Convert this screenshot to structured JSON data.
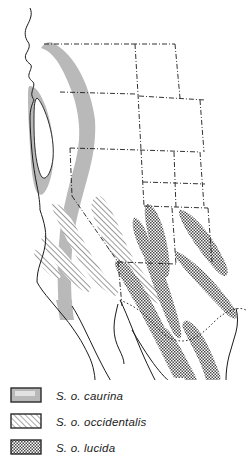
{
  "figure": {
    "kind": "range-map",
    "region": "Western United States and northwestern Mexico",
    "background_color": "#ffffff",
    "line_color": "#1b1b1b",
    "border_style": "dash-dot"
  },
  "legend": {
    "position": "bottom-left",
    "items": [
      {
        "id": "caurina",
        "label": "S. o. caurina",
        "pattern": "solid-gray",
        "fill_color": "#b9b9b9",
        "swatch_border": "#2a2a2a"
      },
      {
        "id": "occidentalis",
        "label": "S. o. occidentalis",
        "pattern": "diagonal-hatch",
        "fill_color": "#ffffff",
        "hatch_color": "#707070",
        "swatch_border": "#2a2a2a"
      },
      {
        "id": "lucida",
        "label": "S. o. lucida",
        "pattern": "dense-stipple",
        "fill_color": "#ffffff",
        "stipple_color": "#4a4a4a",
        "swatch_border": "#2a2a2a"
      }
    ]
  },
  "ranges": [
    {
      "id": "caurina",
      "name": "S. o. caurina",
      "pattern": "solid-gray",
      "description": "Continuous band along the Pacific Northwest coast from southern British Columbia through Washington and Oregon into northwestern California, with an unshaded gap at the Puget Sound lowlands."
    },
    {
      "id": "occidentalis",
      "name": "S. o. occidentalis",
      "pattern": "diagonal-hatch",
      "description": "Hatched band along the California Coast Ranges and the Sierra Nevada, extending south toward the Transverse and Peninsular Ranges."
    },
    {
      "id": "lucida",
      "name": "S. o. lucida",
      "pattern": "dense-stipple",
      "description": "Stippled areas across southern Utah, Colorado, Arizona and New Mexico, continuing south along the Sierra Madre Occidental and a separate Sierra Madre Oriental band in Mexico."
    }
  ],
  "geography": {
    "features": [
      "Pacific coastline",
      "Gulf of California",
      "Baja California peninsula",
      "United States state boundaries",
      "United States – Mexico border"
    ]
  }
}
